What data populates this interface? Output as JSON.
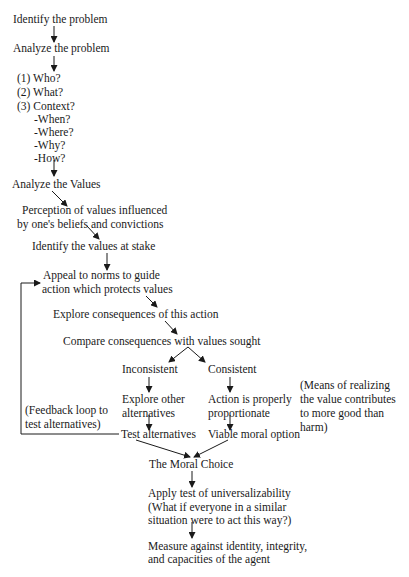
{
  "diagram": {
    "type": "flowchart",
    "nodes": {
      "identify_problem": "Identify the problem",
      "analyze_problem": "Analyze the problem",
      "who": "(1) Who?",
      "what": "(2) What?",
      "context": "(3)  Context?",
      "when": "-When?",
      "where": "-Where?",
      "why": "-Why?",
      "how": "-How?",
      "analyze_values": "Analyze the Values",
      "perception_1": "Perception of values influenced",
      "perception_2": "by one's beliefs and convictions",
      "identify_values": "Identify the values at stake",
      "appeal_1": "Appeal to norms to guide",
      "appeal_2": "action which protects values",
      "explore_consequences": "Explore consequences of this action",
      "compare": "Compare consequences with values sought",
      "inconsistent": "Inconsistent",
      "consistent": "Consistent",
      "explore_other_1": "Explore other",
      "explore_other_2": "alternatives",
      "proportionate_1": "Action is properly",
      "proportionate_2": "proportionate",
      "test_alternatives": "Test alternatives",
      "viable_option": "Viable moral option",
      "moral_choice": "The Moral Choice",
      "universal_1": "Apply test of universalizability",
      "universal_2": "(What if everyone in a similar",
      "universal_3": "situation were to act this way?)",
      "measure_1": "Measure against identity, integrity,",
      "measure_2": "and capacities of the agent"
    },
    "annotations": {
      "feedback_1": "(Feedback loop to",
      "feedback_2": "test alternatives)",
      "means_1": "(Means of realizing",
      "means_2": "the value contributes",
      "means_3": "to more good than",
      "means_4": "harm)"
    }
  }
}
